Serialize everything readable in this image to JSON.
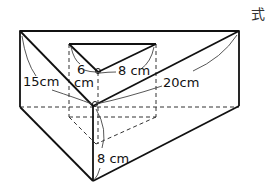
{
  "figure": {
    "type": "triangular-prism-with-hollow",
    "formula_label": "式",
    "labels": {
      "outer_side_left": "15cm",
      "outer_side_right": "20cm",
      "inner_side_left_num": "6",
      "inner_side_left_unit": "cm",
      "inner_side_right": "8 cm",
      "height": "8 cm"
    },
    "right_angle_markers": [
      "outer-triangle-apex",
      "inner-triangle-apex"
    ],
    "colors": {
      "line": "#111111",
      "dashed": "#333333",
      "arc": "#444444",
      "background": "#ffffff"
    }
  }
}
